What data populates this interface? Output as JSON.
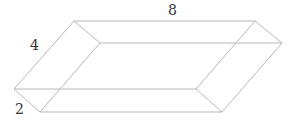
{
  "diagram": {
    "type": "rectangular-prism",
    "labels": {
      "length": "8",
      "width": "4",
      "height": "2"
    },
    "vertices": {
      "A": [
        74,
        21
      ],
      "B": [
        255,
        21
      ],
      "C": [
        282,
        43
      ],
      "D": [
        100,
        43
      ],
      "E": [
        14,
        89
      ],
      "F": [
        196,
        89
      ],
      "G": [
        222,
        112
      ],
      "H": [
        40,
        112
      ]
    },
    "colors": {
      "edge": "#b8b8b8",
      "label": "#333333",
      "background": "#ffffff"
    }
  }
}
